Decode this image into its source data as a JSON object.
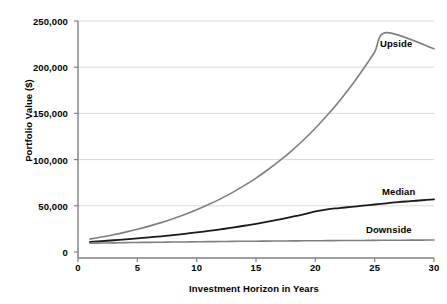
{
  "chart_data": {
    "type": "line",
    "title": "",
    "xlabel": "Investment Horizon in Years",
    "ylabel": "Portfolio Value ($)",
    "xlim": [
      0,
      30
    ],
    "ylim": [
      0,
      250000
    ],
    "grid": true,
    "legend_position": "inline-annotations",
    "xticks": [
      0,
      5,
      10,
      15,
      20,
      25,
      30
    ],
    "xtick_labels": [
      "0",
      "5",
      "10",
      "15",
      "20",
      "25",
      "30"
    ],
    "yticks": [
      0,
      50000,
      100000,
      150000,
      200000,
      250000
    ],
    "ytick_labels": [
      "0",
      "50,000",
      "100,000",
      "150,000",
      "200,000",
      "250,000"
    ],
    "x": [
      1,
      2,
      3,
      4,
      5,
      6,
      7,
      8,
      9,
      10,
      11,
      12,
      13,
      14,
      15,
      16,
      17,
      18,
      19,
      20,
      21,
      22,
      23,
      24,
      25,
      26,
      27,
      28,
      29,
      30
    ],
    "series": [
      {
        "name": "Upside",
        "color": "#7f7f7f",
        "width": 1.6,
        "values": [
          14000,
          16200,
          18700,
          21500,
          24600,
          28000,
          31800,
          36000,
          40600,
          45700,
          51300,
          57500,
          64300,
          71800,
          80000,
          89000,
          98800,
          109500,
          121200,
          134000,
          147900,
          163000,
          179400,
          197200,
          216500,
          237400,
          260000,
          284400,
          310800,
          220000
        ]
      },
      {
        "name": "Median",
        "color": "#1a1a1a",
        "width": 1.8,
        "values": [
          11000,
          11800,
          12700,
          13700,
          14700,
          15800,
          17000,
          18300,
          19700,
          21200,
          22800,
          24500,
          26400,
          28400,
          30500,
          32800,
          35300,
          38000,
          40800,
          43900,
          46200,
          47500,
          48800,
          50100,
          51400,
          52700,
          54000,
          55000,
          56000,
          57000
        ]
      },
      {
        "name": "Downside",
        "color": "#7f7f7f",
        "width": 1.6,
        "values": [
          9500,
          9700,
          9900,
          10100,
          10300,
          10450,
          10600,
          10750,
          10900,
          11050,
          11200,
          11350,
          11500,
          11600,
          11700,
          11800,
          11900,
          12000,
          12100,
          12200,
          12300,
          12400,
          12450,
          12500,
          12600,
          12700,
          12750,
          12800,
          12900,
          13000
        ]
      }
    ],
    "annotations": [
      {
        "text": "Upside",
        "series": "Upside"
      },
      {
        "text": "Median",
        "series": "Median"
      },
      {
        "text": "Downside",
        "series": "Downside"
      }
    ],
    "colors": {
      "gridline": "#d9d9d9",
      "axis": "#808080",
      "text": "#000000",
      "background": "#ffffff"
    }
  }
}
